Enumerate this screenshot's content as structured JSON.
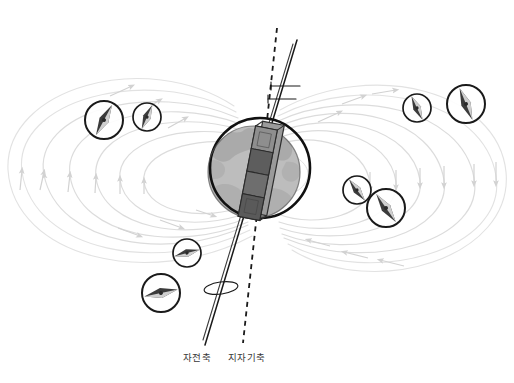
{
  "figure": {
    "background_color": "#ffffff",
    "width": 514,
    "height": 383
  },
  "labels": {
    "rotation_axis": "자전축",
    "geomagnetic_axis": "지자기축"
  },
  "colors": {
    "field_line": "#d8d8d8",
    "field_line_strong": "#c9c9c9",
    "axis_solid": "#1a1a1a",
    "axis_dashed": "#1a1a1a",
    "earth_outline": "#111111",
    "earth_fill": "#b9b9b9",
    "continent": "#a2a2a2",
    "magnet_dark": "#4a4a4a",
    "magnet_mid": "#6e6e6e",
    "magnet_light": "#8c8c8c",
    "compass_ring": "#1a1a1a",
    "needle_dark": "#3b3b3b",
    "needle_light": "#cfcfcf",
    "caption_text": "#3a3a3a"
  },
  "earth": {
    "center_x": 260,
    "center_y": 168,
    "outline_radius": 50,
    "globe_center_x": 254,
    "globe_center_y": 172,
    "globe_radius": 46
  },
  "bar_magnet": {
    "center_x": 262,
    "center_y": 172,
    "length": 92,
    "width": 22,
    "tilt_degrees": 11,
    "band_count": 4
  },
  "axes": {
    "rotation": {
      "style": "solid",
      "x1": 297,
      "y1": 40,
      "x2": 205,
      "y2": 345,
      "label_key": "rotation_axis"
    },
    "geomagnetic": {
      "style": "dashed",
      "x1": 277,
      "y1": 28,
      "x2": 243,
      "y2": 343,
      "label_key": "geomagnetic_axis"
    },
    "tilt_ticks": [
      {
        "x1": 271,
        "y1": 86,
        "x2": 300,
        "y2": 86
      },
      {
        "x1": 268,
        "y1": 98,
        "x2": 297,
        "y2": 98
      }
    ],
    "precession_ellipse": {
      "cx": 221,
      "cy": 288,
      "rx": 17,
      "ry": 6,
      "rotation": -8
    }
  },
  "compasses": [
    {
      "id": "compass-upper-left-outer",
      "cx": 104,
      "cy": 120,
      "r": 19,
      "needle_angle": 28
    },
    {
      "id": "compass-upper-left-inner",
      "cx": 147,
      "cy": 117,
      "r": 14,
      "needle_angle": 24
    },
    {
      "id": "compass-upper-right-inner",
      "cx": 417,
      "cy": 108,
      "r": 14,
      "needle_angle": -25
    },
    {
      "id": "compass-upper-right-outer",
      "cx": 466,
      "cy": 104,
      "r": 19,
      "needle_angle": -22
    },
    {
      "id": "compass-mid-right-inner",
      "cx": 357,
      "cy": 190,
      "r": 14,
      "needle_angle": -37
    },
    {
      "id": "compass-mid-right-outer",
      "cx": 386,
      "cy": 208,
      "r": 19,
      "needle_angle": -35
    },
    {
      "id": "compass-lower-mid",
      "cx": 187,
      "cy": 253,
      "r": 14,
      "needle_angle": 75
    },
    {
      "id": "compass-lower-left",
      "cx": 161,
      "cy": 293,
      "r": 19,
      "needle_angle": 78
    }
  ],
  "field_lines": {
    "description": "dipole magnetic field loops with directional arrowheads",
    "loop_count_per_side": 5,
    "arrow_direction": "from southern hemisphere outward around to northern hemisphere"
  }
}
